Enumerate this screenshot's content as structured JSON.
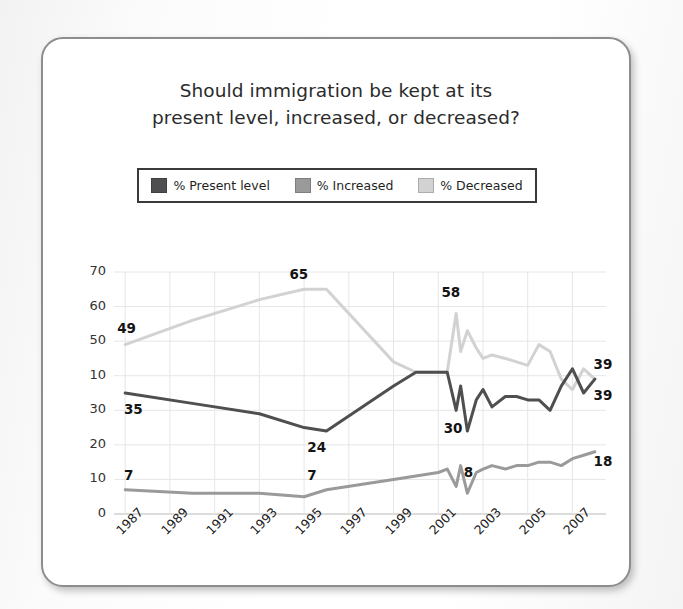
{
  "card": {
    "title_line1": "Should immigration be kept at its",
    "title_line2": "present level, increased, or decreased?"
  },
  "legend": {
    "items": [
      {
        "label": "% Present level",
        "color": "#4f4f4f",
        "key": "present"
      },
      {
        "label": "% Increased",
        "color": "#9a9a9a",
        "key": "increased"
      },
      {
        "label": "% Decreased",
        "color": "#d2d2d2",
        "key": "decreased"
      }
    ]
  },
  "chart_data": {
    "type": "line",
    "title": "Should immigration be kept at its present level, increased, or decreased?",
    "xlabel": "",
    "ylabel": "",
    "ylim": [
      0,
      70
    ],
    "grid": true,
    "legend_position": "top",
    "ytick_labels": [
      "70",
      "60",
      "50",
      "10",
      "30",
      "20",
      "10",
      "0"
    ],
    "ytick_values": [
      70,
      60,
      50,
      40,
      30,
      20,
      10,
      0
    ],
    "xtick_labels": [
      "1987",
      "1989",
      "1991",
      "1993",
      "1995",
      "1997",
      "1999",
      "2001",
      "2003",
      "2005",
      "2007"
    ],
    "xtick_values": [
      1987,
      1989,
      1991,
      1993,
      1995,
      1997,
      1999,
      2001,
      2003,
      2005,
      2007
    ],
    "xlim": [
      1986.5,
      2008.5
    ],
    "series": [
      {
        "name": "% Present level",
        "color": "#4f4f4f",
        "x": [
          1987,
          1990,
          1993,
          1995,
          1996,
          1999,
          2000,
          2001,
          2001.4,
          2001.8,
          2002.0,
          2002.3,
          2002.7,
          2003.0,
          2003.4,
          2004.0,
          2004.5,
          2005.0,
          2005.5,
          2006.0,
          2006.5,
          2007.0,
          2007.5,
          2008.0
        ],
        "values": [
          35,
          32,
          29,
          25,
          24,
          37,
          41,
          41,
          41,
          30,
          37,
          24,
          33,
          36,
          31,
          34,
          34,
          33,
          33,
          30,
          37,
          42,
          35,
          39
        ]
      },
      {
        "name": "% Increased",
        "color": "#9a9a9a",
        "x": [
          1987,
          1990,
          1993,
          1995,
          1996,
          1999,
          2000,
          2001,
          2001.4,
          2001.8,
          2002.0,
          2002.3,
          2002.7,
          2003.0,
          2003.4,
          2004.0,
          2004.5,
          2005.0,
          2005.5,
          2006.0,
          2006.5,
          2007.0,
          2007.5,
          2008.0
        ],
        "values": [
          7,
          6,
          6,
          5,
          7,
          10,
          11,
          12,
          13,
          8,
          14,
          6,
          12,
          13,
          14,
          13,
          14,
          14,
          15,
          15,
          14,
          16,
          17,
          18
        ]
      },
      {
        "name": "% Decreased",
        "color": "#d2d2d2",
        "x": [
          1987,
          1990,
          1993,
          1995,
          1996,
          1999,
          2000,
          2001,
          2001.4,
          2001.8,
          2002.0,
          2002.3,
          2002.7,
          2003.0,
          2003.4,
          2004.0,
          2004.5,
          2005.0,
          2005.5,
          2006.0,
          2006.5,
          2007.0,
          2007.5,
          2008.0
        ],
        "values": [
          49,
          56,
          62,
          65,
          65,
          44,
          41,
          41,
          41,
          58,
          47,
          53,
          48,
          45,
          46,
          45,
          44,
          43,
          49,
          47,
          39,
          36,
          42,
          39
        ]
      }
    ],
    "annotations": [
      {
        "text": "49",
        "x": 1987.0,
        "y": 53.5,
        "series": "% Decreased"
      },
      {
        "text": "35",
        "x": 1987.3,
        "y": 30.0,
        "series": "% Present level"
      },
      {
        "text": "7",
        "x": 1987.3,
        "y": 11.0,
        "series": "% Increased"
      },
      {
        "text": "65",
        "x": 1994.7,
        "y": 69.0,
        "series": "% Decreased"
      },
      {
        "text": "24",
        "x": 1995.5,
        "y": 19.0,
        "series": "% Present level"
      },
      {
        "text": "7",
        "x": 1995.5,
        "y": 11.0,
        "series": "% Increased"
      },
      {
        "text": "58",
        "x": 2001.5,
        "y": 64.0,
        "series": "% Decreased"
      },
      {
        "text": "30",
        "x": 2001.6,
        "y": 24.5,
        "series": "% Present level"
      },
      {
        "text": "8",
        "x": 2002.5,
        "y": 12.0,
        "series": "% Increased"
      },
      {
        "text": "39",
        "x": 2008.3,
        "y": 43.0,
        "series": "% Decreased"
      },
      {
        "text": "39",
        "x": 2008.3,
        "y": 34.0,
        "series": "% Present level"
      },
      {
        "text": "18",
        "x": 2008.3,
        "y": 15.0,
        "series": "% Increased"
      }
    ]
  }
}
